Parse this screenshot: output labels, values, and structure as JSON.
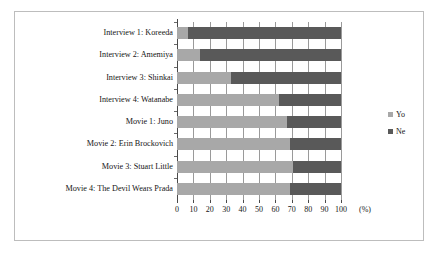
{
  "chart_data": {
    "type": "bar",
    "orientation": "horizontal",
    "stacked": true,
    "stack_mode": "percent",
    "title": "",
    "xlabel": "(%)",
    "ylabel": "",
    "xlim": [
      0,
      100
    ],
    "xticks": [
      0,
      10,
      20,
      30,
      40,
      50,
      60,
      70,
      80,
      90,
      100
    ],
    "xtick_labels": [
      "0",
      "10",
      "20",
      "30",
      "40",
      "50",
      "60",
      "70",
      "80",
      "90",
      "100"
    ],
    "grid": true,
    "grid_axis": "x",
    "legend_position": "right",
    "categories": [
      "Interview 1: Koreeda",
      "Interview 2: Amemiya",
      "Interview 3: Shinkai",
      "Interview 4: Watanabe",
      "Movie 1: Juno",
      "Movie 2: Erin Brockovich",
      "Movie 3: Stuart Little",
      "Movie 4: The Devil Wears Prada"
    ],
    "series": [
      {
        "name": "Yo",
        "color": "#a8a8a8",
        "values": [
          7,
          14,
          33,
          62,
          67,
          69,
          71,
          69
        ]
      },
      {
        "name": "Ne",
        "color": "#595959",
        "values": [
          93,
          86,
          67,
          38,
          33,
          31,
          29,
          31
        ]
      }
    ]
  },
  "legend": {
    "items": [
      {
        "label": "Yo",
        "color": "#a8a8a8"
      },
      {
        "label": "Ne",
        "color": "#595959"
      }
    ]
  },
  "axis": {
    "unit": "(%)"
  }
}
